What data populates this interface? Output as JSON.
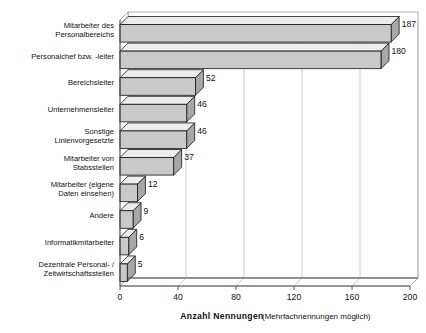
{
  "chart_data": {
    "type": "bar",
    "orientation": "horizontal",
    "style": "3d",
    "title": "",
    "xlabel": "Anzahl  Nennungen",
    "xlabel_note": "(Mehrfachnennungen möglich)",
    "ylabel": "",
    "xlim": [
      0,
      200
    ],
    "grid": true,
    "legend": "none",
    "xticks": [
      "0",
      "40",
      "80",
      "120",
      "160",
      "200"
    ],
    "xtick_values": [
      0,
      40,
      80,
      120,
      160,
      200
    ],
    "categories": [
      "Mitarbeiter des\nPersonalbereichs",
      "Personalchef bzw. -leiter",
      "Bereichsleiter",
      "Unternehmensleiter",
      "Sonstige\nLinienvorgesetzte",
      "Mitarbeiter von\nStabsstellen",
      "Mitarbeiter (eigene\nDaten einsehen)",
      "Andere",
      "Informatikmitarbeiter",
      "Dezentrale Personal- /\nZeitwirtschaftsstellen"
    ],
    "values": [
      187,
      180,
      52,
      46,
      46,
      37,
      12,
      9,
      6,
      5
    ],
    "value_labels": [
      "187",
      "180",
      "52",
      "46",
      "46",
      "37",
      "12",
      "9",
      "6",
      "5"
    ],
    "colors": {
      "bar_front": "#c9c9c9",
      "bar_top": "#ededed",
      "bar_side": "#a7a7a7",
      "bar_outline": "#141414",
      "gridline": "#b4b4b4",
      "axis": "#4a4a4a",
      "background": "#ffffff",
      "text": "#111111"
    }
  }
}
